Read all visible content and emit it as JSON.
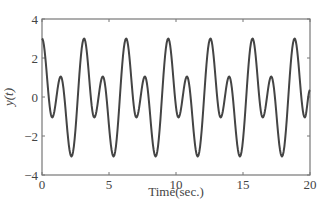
{
  "chart_data": {
    "type": "line",
    "title": "",
    "xlabel": "Time(sec.)",
    "ylabel": "y(t)",
    "xlim": [
      0,
      20
    ],
    "ylim": [
      -4,
      4
    ],
    "xticks": [
      0,
      5,
      10,
      15,
      20
    ],
    "xtick_labels": [
      "0",
      "5",
      "10",
      "15",
      "20"
    ],
    "yticks": [
      4,
      2,
      0,
      -2,
      -4
    ],
    "ytick_labels": [
      "4",
      "2",
      "0",
      "−2",
      "−4"
    ],
    "grid": false,
    "legend": null,
    "line_color": "#444444",
    "axis_color": "#777777",
    "series": [
      {
        "name": "y(t)",
        "description": "periodic signal, period ~pi s; extrema listed (t, y)",
        "x": [
          0,
          0.76,
          1.4,
          2.2,
          3.14,
          3.9,
          4.54,
          5.34,
          6.28,
          7.04,
          7.68,
          8.48,
          9.42,
          10.18,
          10.82,
          11.62,
          12.57,
          13.33,
          13.97,
          14.77,
          15.71,
          16.47,
          17.11,
          17.91,
          18.85,
          19.61,
          20.0
        ],
        "values": [
          3,
          -1.05,
          1.05,
          -3.05,
          3,
          -1.05,
          1.05,
          -3.05,
          3,
          -1.05,
          1.05,
          -3.05,
          3,
          -1.05,
          1.05,
          -3.05,
          3,
          -1.05,
          1.05,
          -3.05,
          3,
          -1.05,
          1.05,
          -3.05,
          3,
          -1.05,
          0.36
        ]
      }
    ]
  }
}
